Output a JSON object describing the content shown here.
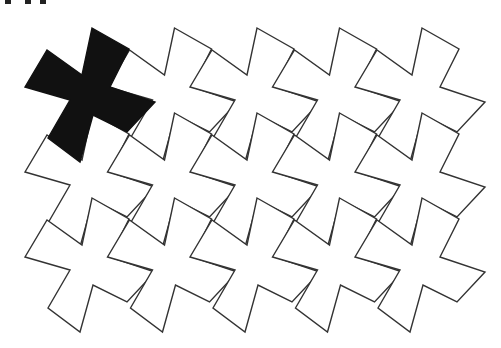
{
  "figure": {
    "background": "#ffffff",
    "stroke_color": "#333333",
    "stroke_width": 1.4,
    "highlight_fill": "#111111",
    "tile_fill": "#ffffff"
  },
  "tile": {
    "points": [
      [
        92,
        28
      ],
      [
        129,
        49
      ],
      [
        110,
        87
      ],
      [
        155,
        102
      ],
      [
        127,
        132
      ],
      [
        93,
        115
      ],
      [
        80,
        162
      ],
      [
        48,
        138
      ],
      [
        70,
        100
      ],
      [
        25,
        87
      ],
      [
        47,
        50
      ],
      [
        82,
        75
      ]
    ]
  },
  "grid": {
    "rows": 3,
    "cols": 5,
    "dx": 82.5,
    "dy": 85,
    "highlighted": [
      [
        0,
        0
      ]
    ]
  },
  "crop_artifacts": [
    {
      "x": 5,
      "w": 6
    },
    {
      "x": 25,
      "w": 6
    },
    {
      "x": 40,
      "w": 6
    }
  ]
}
